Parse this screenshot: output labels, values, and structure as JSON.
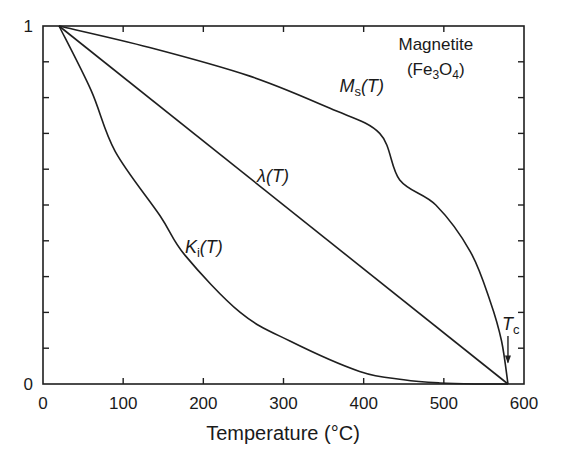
{
  "chart_data": {
    "type": "line",
    "title": "",
    "xlabel": "Temperature (°C)",
    "ylabel": "",
    "xlim": [
      0,
      600
    ],
    "ylim": [
      0,
      1
    ],
    "xticks": [
      0,
      100,
      200,
      300,
      400,
      500,
      600
    ],
    "yticks_labeled": [
      0,
      1
    ],
    "yticks_minor_step": 0.1,
    "grid": false,
    "legend": null,
    "annotations": [
      {
        "text": "Magnetite",
        "x": 490,
        "y": 0.95
      },
      {
        "text": "(Fe3O4)",
        "x": 490,
        "y": 0.88
      },
      {
        "text": "Tc",
        "x": 580,
        "y": 0.14,
        "arrow_to": [
          580,
          0.06
        ]
      }
    ],
    "series": [
      {
        "name": "Ms(T)",
        "label_main": "M",
        "label_sub": "s",
        "label_pos": [
          370,
          0.815
        ],
        "x": [
          20,
          133,
          258,
          358,
          420,
          445,
          490,
          533,
          558,
          572,
          580
        ],
        "y": [
          1.0,
          0.94,
          0.86,
          0.77,
          0.7,
          0.57,
          0.5,
          0.37,
          0.23,
          0.12,
          0.0
        ]
      },
      {
        "name": "λ(T)",
        "label_main": "λ",
        "label_sub": "",
        "label_pos": [
          267,
          0.565
        ],
        "x": [
          20,
          580
        ],
        "y": [
          1.0,
          0.0
        ]
      },
      {
        "name": "Ki(T)",
        "label_main": "K",
        "label_sub": "i",
        "label_pos": [
          177,
          0.365
        ],
        "x": [
          20,
          60,
          90,
          146,
          177,
          246,
          308,
          395,
          450,
          495,
          540,
          580
        ],
        "y": [
          1.0,
          0.82,
          0.65,
          0.47,
          0.36,
          0.2,
          0.12,
          0.035,
          0.012,
          0.003,
          0.0,
          0.0
        ]
      }
    ]
  }
}
